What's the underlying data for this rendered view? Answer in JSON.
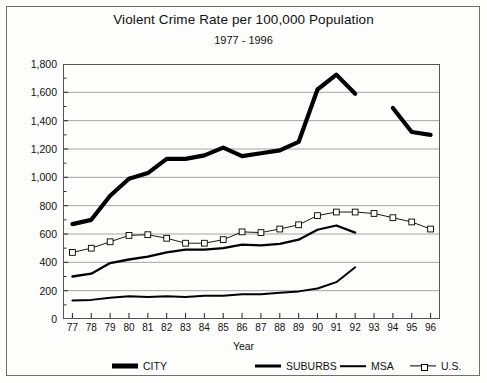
{
  "chart_data": {
    "type": "line",
    "title": "Violent Crime Rate per 100,000 Population",
    "subtitle": "1977 - 1996",
    "xlabel": "Year",
    "ylabel": "",
    "categories": [
      "77",
      "78",
      "79",
      "80",
      "81",
      "82",
      "83",
      "84",
      "85",
      "86",
      "87",
      "88",
      "89",
      "90",
      "91",
      "92",
      "93",
      "94",
      "95",
      "96"
    ],
    "ylim": [
      0,
      1800
    ],
    "ytick_labels": [
      "0",
      "200",
      "400",
      "600",
      "800",
      "1,000",
      "1,200",
      "1,400",
      "1,600",
      "1,800"
    ],
    "ytick_values": [
      0,
      200,
      400,
      600,
      800,
      1000,
      1200,
      1400,
      1600,
      1800
    ],
    "ytick_step": 200,
    "minor_tick_step": 100,
    "grid": "horizontal",
    "legend_position": "bottom",
    "series": [
      {
        "name": "CITY",
        "style": "thick-solid",
        "color": "#000000",
        "values": [
          670,
          700,
          870,
          990,
          1030,
          1130,
          1130,
          1155,
          1210,
          1150,
          1170,
          1190,
          1250,
          1620,
          1725,
          1590,
          null,
          1490,
          1320,
          1300
        ]
      },
      {
        "name": "SUBURBS",
        "style": "medium-solid",
        "color": "#000000",
        "values": [
          300,
          320,
          395,
          420,
          440,
          470,
          490,
          490,
          500,
          525,
          520,
          530,
          560,
          630,
          660,
          610,
          null,
          null,
          null,
          null
        ]
      },
      {
        "name": "MSA",
        "style": "thin-solid",
        "color": "#000000",
        "values": [
          130,
          135,
          150,
          160,
          155,
          160,
          155,
          165,
          165,
          175,
          175,
          185,
          195,
          215,
          260,
          365,
          null,
          null,
          null,
          null
        ]
      },
      {
        "name": "U.S.",
        "style": "thin-solid-square-markers",
        "color": "#000000",
        "marker": "open-square",
        "values": [
          470,
          500,
          545,
          590,
          595,
          570,
          535,
          535,
          560,
          615,
          610,
          635,
          665,
          730,
          755,
          755,
          745,
          715,
          685,
          635
        ]
      }
    ]
  },
  "legend": {
    "items": [
      {
        "label": "CITY",
        "swatch": "thick-line"
      },
      {
        "label": "SUBURBS",
        "swatch": "medium-line"
      },
      {
        "label": "MSA",
        "swatch": "thin-line"
      },
      {
        "label": "U.S.",
        "swatch": "thin-line-open-square"
      }
    ]
  },
  "colors": {
    "ink": "#000000",
    "frame": "#6f6f6f",
    "grid": "#9a9a9a",
    "background": "#fdfdfb"
  }
}
